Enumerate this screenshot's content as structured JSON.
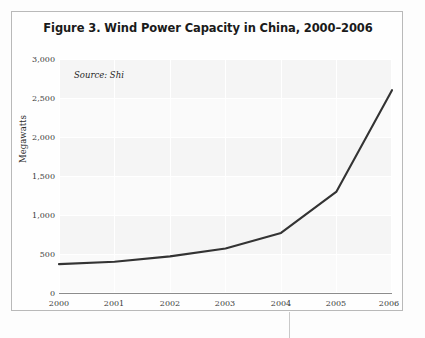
{
  "figure": {
    "title": "Figure 3. Wind Power Capacity in China, 2000–2006",
    "source_note": "Source: Shi",
    "frame_color": "#b9b9b9",
    "line_color": "#333333",
    "plot_background": "#fafafa",
    "grid_color": "#ffffff"
  },
  "chart_data": {
    "type": "line",
    "title": "Figure 3. Wind Power Capacity in China, 2000–2006",
    "xlabel": "",
    "ylabel": "Megawatts",
    "categories": [
      "2000",
      "2001",
      "2002",
      "2003",
      "2004",
      "2005",
      "2006"
    ],
    "x": [
      2000,
      2001,
      2002,
      2003,
      2004,
      2005,
      2006
    ],
    "values": [
      370,
      400,
      470,
      570,
      770,
      1300,
      2600
    ],
    "series": [
      {
        "name": "Wind power capacity",
        "color": "#333333",
        "values": [
          370,
          400,
          470,
          570,
          770,
          1300,
          2600
        ]
      }
    ],
    "ylim": [
      0,
      3000
    ],
    "xlim": [
      2000,
      2006
    ],
    "yticks": [
      0,
      500,
      1000,
      1500,
      2000,
      2500,
      3000
    ],
    "ytick_labels": [
      "0",
      "500",
      "1,000",
      "1,500",
      "2,000",
      "2,500",
      "3,000"
    ],
    "xtick_labels": [
      "2000",
      "2001",
      "2002",
      "2003",
      "2004",
      "2005",
      "2006"
    ],
    "grid": true,
    "legend": "none",
    "annotations": [
      "Source: Shi"
    ]
  }
}
